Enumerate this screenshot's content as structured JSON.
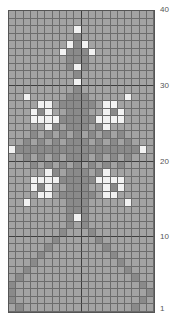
{
  "chart_data": {
    "type": "heatmap",
    "title": "",
    "columns": 20,
    "rows": 40,
    "legend": {
      ".": "background (medium gray)",
      "d": "dark gray stitch",
      "w": "white stitch"
    },
    "colors": {
      ".": "#a3a3a3",
      "d": "#8a8a8a",
      "w": "#f2f2f2",
      "grid": "#6c6c6c",
      "grid_major": "#3e3e3e"
    },
    "row_labels": [
      {
        "row": 40,
        "label": "40"
      },
      {
        "row": 30,
        "label": "30"
      },
      {
        "row": 20,
        "label": "20"
      },
      {
        "row": 10,
        "label": "10"
      },
      {
        "row": 1,
        "label": "1"
      }
    ],
    "grid_rows_top_to_bottom": [
      "....................",
      "....................",
      ".........w..........",
      ".........d..........",
      "........wdw.........",
      ".......wdddw........",
      "........ddd.........",
      "........dwd.........",
      ".........d..........",
      ".........w..........",
      ".........d..........",
      "..w.....ddd.....w...",
      "....ww.ddddd.ww.....",
      "...wdw..ddd..wdw....",
      "...wwwwdddddwwww....",
      ".....wd.ddd.dw......",
      "...d.d.d.d.d.d.d....",
      "..d.d.d.ddd.d.d.d...",
      "wdddddddddddddddddw.",
      "..d.d.d.ddd.d.d.d...",
      "...d.d.d.d.d.d.d....",
      ".....wd.ddd.dw......",
      "...wwwwdddddwwww....",
      "...wdw..ddd..wdw....",
      "....ww.ddddd.ww.....",
      "..w.....ddd.....w...",
      "........ddd.........",
      "........dwd.........",
      "........d.d.........",
      ".......d...d........",
      "......d.....d.......",
      ".....d.......d......",
      "....d.........d.....",
      "...d...........d....",
      "..d.............d...",
      ".d...............d..",
      "d.................d.",
      "d..................d",
      "d.................d.",
      ".d...............d.."
    ]
  }
}
